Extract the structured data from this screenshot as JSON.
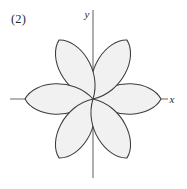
{
  "figure": {
    "number_label": "(2)",
    "background_color": "#ffffff",
    "width": 187,
    "height": 189
  },
  "axes": {
    "origin": {
      "x": 93,
      "y": 99
    },
    "color": "#6b6b6b",
    "x_axis": {
      "label": "x",
      "label_position": {
        "x": 172,
        "y": 103
      },
      "start": {
        "x": 10,
        "y": 99
      },
      "end": {
        "x": 168,
        "y": 99
      }
    },
    "y_axis": {
      "label": "y",
      "label_position": {
        "x": 87,
        "y": 18
      },
      "start": {
        "x": 93,
        "y": 10
      },
      "end": {
        "x": 93,
        "y": 178
      }
    }
  },
  "chart_data": {
    "type": "line",
    "title": "",
    "subtitle": "",
    "xlabel": "x",
    "ylabel": "y",
    "plot_kind": "polar-rose",
    "curve_description": "six-petaled rose curve centered at the origin",
    "petal_count": 6,
    "petal_length_px": 68,
    "petal_half_width_deg": 15,
    "petal_angles_deg": [
      0,
      60,
      120,
      180,
      240,
      300
    ],
    "fill_color": "#f1f1f1",
    "stroke_color": "#3c3c3c",
    "grid": false,
    "legend": "none",
    "xlim": [
      -83,
      75
    ],
    "ylim": [
      -79,
      89
    ],
    "annotations": [
      "(2)"
    ]
  }
}
